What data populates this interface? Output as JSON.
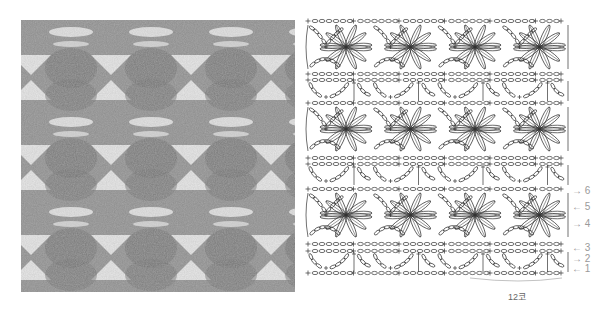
{
  "figure": {
    "photo_alt": "Crocheted swatch in gray yarn showing butterfly cluster lace pattern",
    "chart_alt": "Crochet symbol chart of butterfly cluster lace pattern",
    "stitch_repeat_label": "12코",
    "row_labels": [
      {
        "num": "6",
        "dir": "right"
      },
      {
        "num": "5",
        "dir": "left"
      },
      {
        "num": "4",
        "dir": "right"
      },
      {
        "num": "3",
        "dir": "left"
      },
      {
        "num": "2",
        "dir": "right"
      },
      {
        "num": "1",
        "dir": "left"
      }
    ]
  },
  "colors": {
    "yarn": "#8c8c8c",
    "yarn_dark": "#6f6f6f",
    "hole": "#f2f2f2",
    "ink": "#333333",
    "label": "#9a9a9a"
  }
}
